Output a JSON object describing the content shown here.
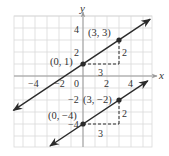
{
  "chart_data": {
    "type": "line",
    "title": "",
    "xlabel": "x",
    "ylabel": "y",
    "xlim": [
      -5.75,
      5.75
    ],
    "ylim": [
      -5.9,
      5.0
    ],
    "grid": true,
    "x_ticks": [
      -4,
      -2,
      0,
      2,
      4
    ],
    "y_ticks": [
      4,
      2,
      -2,
      -4
    ],
    "series": [
      {
        "name": "y = (2/3)x + 1",
        "slope": 0.6667,
        "intercept": 1,
        "x_range": [
          -5.8,
          5.6
        ],
        "points": [
          {
            "x": 0,
            "y": 1,
            "label": "(0, 1)"
          },
          {
            "x": 3,
            "y": 3,
            "label": "(3, 3)"
          }
        ],
        "run": {
          "label": "3"
        },
        "rise": {
          "label": "2"
        }
      },
      {
        "name": "y = (2/3)x - 4",
        "slope": 0.6667,
        "intercept": -4,
        "x_range": [
          -2.75,
          5.4
        ],
        "points": [
          {
            "x": 0,
            "y": -4,
            "label": "(0, -4)"
          },
          {
            "x": 3,
            "y": -2,
            "label": "(3, -2)"
          }
        ],
        "run": {
          "label": "3"
        },
        "rise": {
          "label": "2"
        }
      }
    ],
    "colors": {
      "line": "#2b2b2b",
      "grid": "#d9d9d9",
      "axis": "#9a9a9a",
      "dash": "#2b2b2b",
      "text": "#333333"
    }
  },
  "labels": {
    "x_axis": "x",
    "y_axis": "y",
    "ticks": {
      "xm4": "−4",
      "xm2": "−2",
      "x0": "0",
      "x2": "2",
      "x4": "4",
      "y4": "4",
      "y2": "2",
      "ym2": "−2",
      "ym4": "−4"
    },
    "line1": {
      "p1": "(0, 1)",
      "p2": "(3, 3)",
      "run": "3",
      "rise": "2"
    },
    "line2": {
      "p1": "(0, −4)",
      "p2": "(3, −2)",
      "run": "3",
      "rise": "2"
    }
  }
}
